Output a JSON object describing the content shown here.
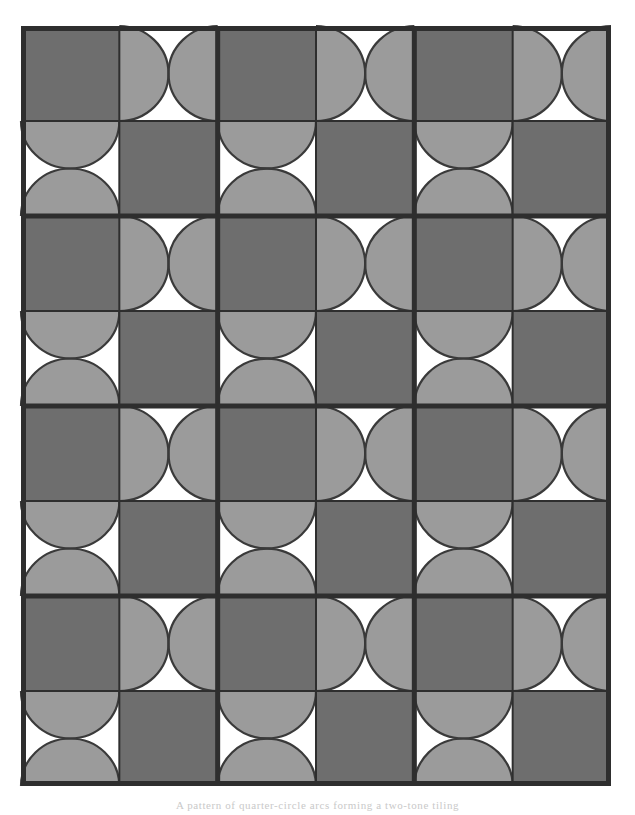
{
  "figure": {
    "kind": "geometric-pattern",
    "grid": {
      "columns": 6,
      "rows": 8,
      "block_columns": 3,
      "block_rows": 4,
      "cells_per_block_x": 2,
      "cells_per_block_y": 2
    },
    "geometry": {
      "outer_left": 21,
      "outer_top": 26,
      "outer_right": 611,
      "outer_bottom": 786,
      "cell_width": 98.3,
      "cell_height": 95.0,
      "outer_border_width": 5,
      "block_line_width": 5,
      "cell_line_width": 2,
      "arc_stroke_width": 2.2
    },
    "colors": {
      "dark_fill": "#6e6e6e",
      "light_fill": "#9b9b9b",
      "void_fill": "#ffffff",
      "line_color": "#2e2e2e",
      "arc_color": "#3a3a3a",
      "page_background": "#ffffff",
      "caption_color": "#c9c9c9"
    },
    "legend": [
      {
        "swatch": "#6e6e6e",
        "label": "solid dark square"
      },
      {
        "swatch": "#9b9b9b",
        "label": "light square with opposed arcs"
      },
      {
        "swatch": "#ffffff",
        "label": "white lens / bowtie void"
      }
    ],
    "cell_types": {
      "solid": "solid",
      "arcs_horizontal": "arcs-horizontal",
      "arcs_vertical": "arcs-vertical"
    },
    "pattern_rows": [
      [
        "solid",
        "arcs-horizontal",
        "solid",
        "arcs-horizontal",
        "solid",
        "arcs-horizontal"
      ],
      [
        "arcs-vertical",
        "solid",
        "arcs-vertical",
        "solid",
        "arcs-vertical",
        "solid"
      ],
      [
        "solid",
        "arcs-horizontal",
        "solid",
        "arcs-horizontal",
        "solid",
        "arcs-horizontal"
      ],
      [
        "arcs-vertical",
        "solid",
        "arcs-vertical",
        "solid",
        "arcs-vertical",
        "solid"
      ],
      [
        "solid",
        "arcs-horizontal",
        "solid",
        "arcs-horizontal",
        "solid",
        "arcs-horizontal"
      ],
      [
        "arcs-vertical",
        "solid",
        "arcs-vertical",
        "solid",
        "arcs-vertical",
        "solid"
      ],
      [
        "solid",
        "arcs-horizontal",
        "solid",
        "arcs-horizontal",
        "solid",
        "arcs-horizontal"
      ],
      [
        "arcs-vertical",
        "solid",
        "arcs-vertical",
        "solid",
        "arcs-vertical",
        "solid"
      ]
    ]
  },
  "caption": {
    "text": "A pattern of quarter-circle arcs forming a two-tone tiling"
  }
}
